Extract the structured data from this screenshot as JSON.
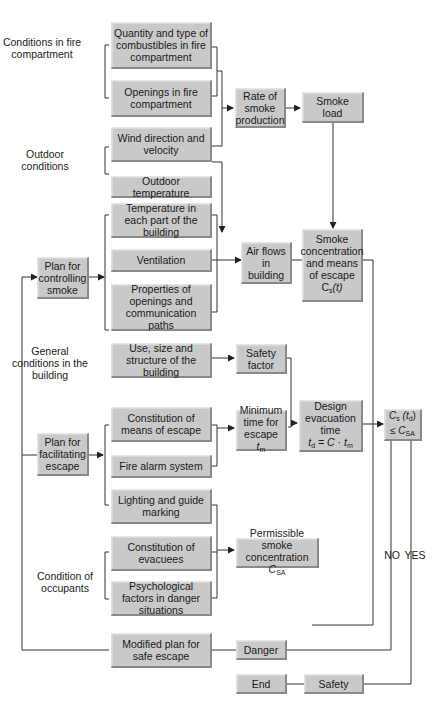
{
  "groups": {
    "fire_compartment": "Conditions in fire compartment",
    "outdoor": "Outdoor conditions",
    "general": "General conditions in the building",
    "occupants": "Condition of occupants"
  },
  "boxes": {
    "combustibles": "Quantity and type of combustibles in fire compartment",
    "openings_fire": "Openings in fire compartment",
    "wind": "Wind direction and velocity",
    "outdoor_temp": "Outdoor temperature",
    "temp_each_part": "Temperature in each part of the building",
    "ventilation": "Ventilation",
    "properties_openings": "Properties of openings and communication paths",
    "use_size": "Use, size and structure of the building",
    "plan_smoke": "Plan for controlling smoke",
    "plan_escape": "Plan for facilitating escape",
    "constitution_means": "Constitution of means of escape",
    "fire_alarm": "Fire alarm system",
    "lighting": "Lighting and guide marking",
    "constitution_evacuees": "Constitution of evacuees",
    "psychological": "Psychological factors in danger situations",
    "modified_plan": "Modified plan for safe escape",
    "rate_smoke": "Rate of smoke production",
    "smoke_load": "Smoke load",
    "air_flows": "Air flows in building",
    "smoke_conc": {
      "text": "Smoke concentration and means of escape",
      "symbol": "C",
      "sub": "s",
      "arg": "(t)"
    },
    "safety_factor": "Safety factor",
    "min_time": {
      "text": "Minimum time for escape",
      "symbol": "t",
      "sub": "m"
    },
    "design_time": {
      "text": "Design evacuation time",
      "formula_lhs": "t",
      "lhs_sub": "d",
      "formula_rhs": "= C · t",
      "rhs_sub": "m"
    },
    "permissible": {
      "text": "Permissible smoke concentration",
      "symbol": "C",
      "sub": "SA"
    },
    "decision": {
      "lhs": "C",
      "lhs_sub": "s",
      "arg": "(t",
      "arg_sub": "d",
      "arg_close": ")",
      "op": "≤ C",
      "rhs_sub": "SA"
    },
    "danger": "Danger",
    "end": "End",
    "safety": "Safety"
  },
  "branch_labels": {
    "no": "NO",
    "yes": "YES"
  },
  "colors": {
    "box_fill": "#c9c9c9",
    "line": "#333333",
    "background": "#ffffff"
  }
}
